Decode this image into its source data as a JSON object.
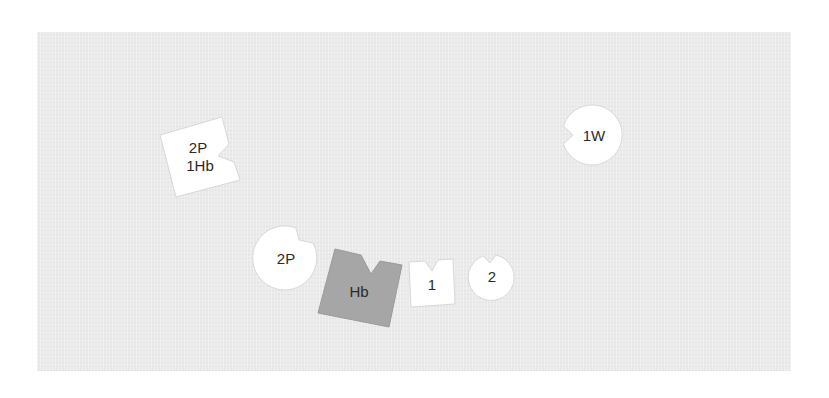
{
  "figure": {
    "background_color": "#eaeaea",
    "shapes": [
      {
        "id": "square-2p-1hb",
        "kind": "notched-square",
        "fill": "#ffffff",
        "lines": [
          "2P",
          "1Hb"
        ]
      },
      {
        "id": "circle-1w",
        "kind": "notched-circle",
        "fill": "#ffffff",
        "lines": [
          "1W"
        ]
      },
      {
        "id": "circle-2p",
        "kind": "notched-circle",
        "fill": "#ffffff",
        "lines": [
          "2P"
        ]
      },
      {
        "id": "square-hb",
        "kind": "notched-square",
        "fill": "#a6a6a6",
        "lines": [
          "Hb"
        ]
      },
      {
        "id": "square-1",
        "kind": "notched-square",
        "fill": "#ffffff",
        "lines": [
          "1"
        ]
      },
      {
        "id": "circle-2",
        "kind": "notched-circle",
        "fill": "#ffffff",
        "lines": [
          "2"
        ]
      }
    ]
  }
}
